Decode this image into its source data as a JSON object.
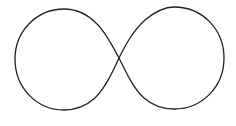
{
  "figure": {
    "shape": "infinity-symbol",
    "stroke_color": "#222222",
    "background": "#ffffff",
    "stroke_width": 1.3,
    "crossing_point": [
      119,
      58
    ],
    "left_loop": {
      "left": 15,
      "top": 9,
      "bottom": 110
    },
    "right_loop": {
      "right": 224,
      "top": 7,
      "bottom": 109
    }
  }
}
